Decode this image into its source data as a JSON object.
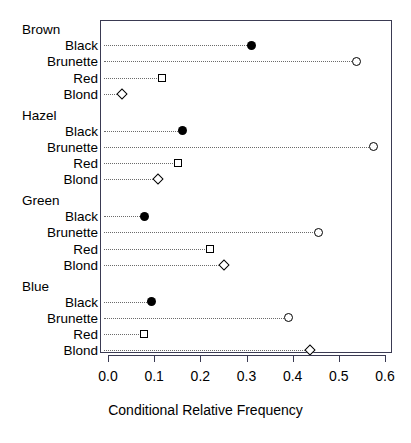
{
  "chart_data": {
    "type": "scatter",
    "subtype": "dot-plot",
    "title": "",
    "xlabel": "Conditional Relative Frequency",
    "ylabel": "",
    "xlim": [
      0.0,
      0.6
    ],
    "xticks": [
      "0.0",
      "0.1",
      "0.2",
      "0.3",
      "0.4",
      "0.5",
      "0.6"
    ],
    "xtick_values": [
      0.0,
      0.1,
      0.2,
      0.3,
      0.4,
      0.5,
      0.6
    ],
    "grid": false,
    "legend": "none",
    "leader_lines": true,
    "groups": [
      {
        "name": "Brown",
        "rows": [
          {
            "label": "Black",
            "value": 0.311,
            "marker": "filled-circle"
          },
          {
            "label": "Brunette",
            "value": 0.539,
            "marker": "open-circle"
          },
          {
            "label": "Red",
            "value": 0.117,
            "marker": "open-square"
          },
          {
            "label": "Blond",
            "value": 0.03,
            "marker": "open-diamond"
          }
        ]
      },
      {
        "name": "Hazel",
        "rows": [
          {
            "label": "Black",
            "value": 0.162,
            "marker": "filled-circle"
          },
          {
            "label": "Brunette",
            "value": 0.576,
            "marker": "open-circle"
          },
          {
            "label": "Red",
            "value": 0.152,
            "marker": "open-square"
          },
          {
            "label": "Blond",
            "value": 0.108,
            "marker": "open-diamond"
          }
        ]
      },
      {
        "name": "Green",
        "rows": [
          {
            "label": "Black",
            "value": 0.08,
            "marker": "filled-circle"
          },
          {
            "label": "Brunette",
            "value": 0.455,
            "marker": "open-circle"
          },
          {
            "label": "Red",
            "value": 0.221,
            "marker": "open-square"
          },
          {
            "label": "Blond",
            "value": 0.251,
            "marker": "open-diamond"
          }
        ]
      },
      {
        "name": "Blue",
        "rows": [
          {
            "label": "Black",
            "value": 0.095,
            "marker": "filled-circle"
          },
          {
            "label": "Brunette",
            "value": 0.392,
            "marker": "open-circle"
          },
          {
            "label": "Red",
            "value": 0.078,
            "marker": "open-square"
          },
          {
            "label": "Blond",
            "value": 0.437,
            "marker": "open-diamond"
          }
        ]
      }
    ]
  },
  "colors": {
    "frame": "#3a3a52",
    "marker": "#000000",
    "leader": "#6b6b6b",
    "background": "#ffffff"
  }
}
